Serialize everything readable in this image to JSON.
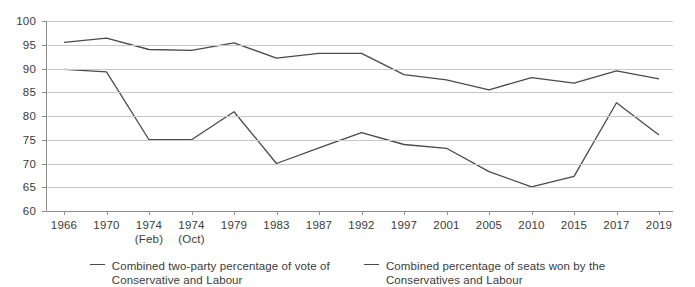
{
  "chart_data": {
    "type": "line",
    "title": "",
    "xlabel": "",
    "ylabel": "",
    "ylim": [
      60,
      100
    ],
    "ytick_step": 5,
    "yticks": [
      100,
      95,
      90,
      85,
      80,
      75,
      70,
      65,
      60
    ],
    "grid": true,
    "legend_position": "bottom",
    "categories": [
      "1966",
      "1970",
      "1974",
      "1974",
      "1979",
      "1983",
      "1987",
      "1992",
      "1997",
      "2001",
      "2005",
      "2010",
      "2015",
      "2017",
      "2019"
    ],
    "category_sublabels": [
      "",
      "",
      "(Feb)",
      "(Oct)",
      "",
      "",
      "",
      "",
      "",
      "",
      "",
      "",
      "",
      "",
      ""
    ],
    "series": [
      {
        "name": "Combined two-party percentage of vote of Conservative and Labour",
        "color": "#4a4a4a",
        "values": [
          95.5,
          96.4,
          94.0,
          93.8,
          95.4,
          92.2,
          93.2,
          93.2,
          88.7,
          87.6,
          85.5,
          88.1,
          86.9,
          89.5,
          87.8
        ]
      },
      {
        "name": "Combined percentage of seats won by the Conservatives and Labour",
        "color": "#4a4a4a",
        "values": [
          89.8,
          89.3,
          75.0,
          75.0,
          80.9,
          70.0,
          73.3,
          76.5,
          74.0,
          73.2,
          68.3,
          65.1,
          67.3,
          82.8,
          76.0
        ]
      }
    ]
  },
  "legend": {
    "items": [
      {
        "label_line1": "Combined two-party percentage of vote of",
        "label_line2": "Conservative and Labour"
      },
      {
        "label_line1": "Combined percentage of seats won by the",
        "label_line2": "Conservatives and Labour"
      }
    ]
  }
}
